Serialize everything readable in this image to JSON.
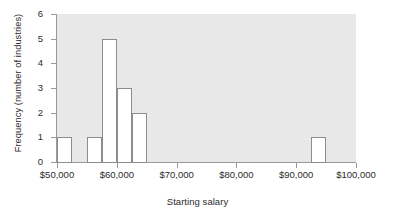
{
  "chart_data": {
    "type": "bar",
    "title": "",
    "xlabel": "Starting salary",
    "ylabel": "Frequency (number of industries)",
    "xlim": [
      50000,
      100000
    ],
    "ylim": [
      0,
      6
    ],
    "bin_width": 2500,
    "grid": false,
    "legend": null,
    "x_tick_labels": [
      "$50,000",
      "$60,000",
      "$70,000",
      "$80,000",
      "$90,000",
      "$100,000"
    ],
    "x_tick_values": [
      50000,
      60000,
      70000,
      80000,
      90000,
      100000
    ],
    "y_tick_labels": [
      "0",
      "1",
      "2",
      "3",
      "4",
      "5",
      "6"
    ],
    "y_tick_values": [
      0,
      1,
      2,
      3,
      4,
      5,
      6
    ],
    "bins": [
      {
        "start": 50000,
        "end": 52500,
        "value": 1
      },
      {
        "start": 52500,
        "end": 55000,
        "value": 0
      },
      {
        "start": 55000,
        "end": 57500,
        "value": 1
      },
      {
        "start": 57500,
        "end": 60000,
        "value": 5
      },
      {
        "start": 60000,
        "end": 62500,
        "value": 3
      },
      {
        "start": 62500,
        "end": 65000,
        "value": 2
      },
      {
        "start": 65000,
        "end": 67500,
        "value": 0
      },
      {
        "start": 67500,
        "end": 70000,
        "value": 0
      },
      {
        "start": 70000,
        "end": 72500,
        "value": 0
      },
      {
        "start": 72500,
        "end": 75000,
        "value": 0
      },
      {
        "start": 75000,
        "end": 77500,
        "value": 0
      },
      {
        "start": 77500,
        "end": 80000,
        "value": 0
      },
      {
        "start": 80000,
        "end": 82500,
        "value": 0
      },
      {
        "start": 82500,
        "end": 85000,
        "value": 0
      },
      {
        "start": 85000,
        "end": 87500,
        "value": 0
      },
      {
        "start": 87500,
        "end": 90000,
        "value": 0
      },
      {
        "start": 90000,
        "end": 92500,
        "value": 0
      },
      {
        "start": 92500,
        "end": 95000,
        "value": 1
      },
      {
        "start": 95000,
        "end": 97500,
        "value": 0
      },
      {
        "start": 97500,
        "end": 100000,
        "value": 0
      }
    ],
    "colors": {
      "plot_background": "#e8e8e8",
      "bar_fill": "#ffffff",
      "bar_edge": "#8d8d8d",
      "axis": "#9a9a9a",
      "text": "#2b2b2b"
    }
  }
}
